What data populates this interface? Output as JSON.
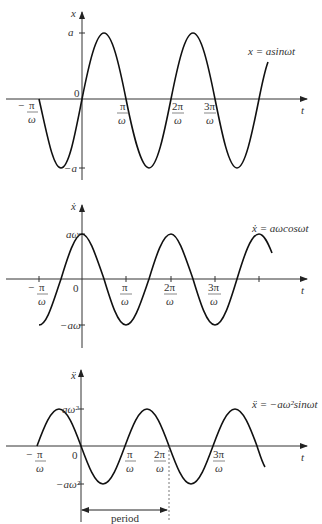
{
  "figure": {
    "cropped_header": "",
    "panels": [
      {
        "id": "displacement",
        "y_axis_label": "x",
        "x_axis_label": "t",
        "equation": "x = asinωt",
        "y_ticks": [
          "a",
          "−a"
        ],
        "origin_label": "0",
        "x_ticks": [
          "−π/ω",
          "π/ω",
          "2π/ω",
          "3π/ω"
        ]
      },
      {
        "id": "velocity",
        "y_axis_label": "ẋ",
        "x_axis_label": "t",
        "equation": "ẋ = aωcosωt",
        "y_ticks": [
          "aω",
          "−aω"
        ],
        "origin_label": "0",
        "x_ticks": [
          "−π/ω",
          "π/ω",
          "2π/ω",
          "3π/ω"
        ]
      },
      {
        "id": "acceleration",
        "y_axis_label": "ẍ",
        "x_axis_label": "t",
        "equation": "ẍ = −aω²sinωt",
        "y_ticks": [
          "aω²",
          "−aω²"
        ],
        "origin_label": "0",
        "x_ticks": [
          "−π/ω",
          "π/ω",
          "2π/ω",
          "3π/ω"
        ],
        "annotation": "period"
      }
    ]
  },
  "labels": {
    "p1": {
      "y": "x",
      "t": "t",
      "a": "a",
      "neg_a": "−a",
      "zero": "0",
      "eq": "x = asinωt"
    },
    "p2": {
      "y": "ẋ",
      "t": "t",
      "a": "aω",
      "neg_a": "−aω",
      "zero": "0",
      "eq": "ẋ = aωcosωt"
    },
    "p3": {
      "y": "ẍ",
      "t": "t",
      "a": "aω²",
      "neg_a": "−aω²",
      "zero": "0",
      "eq": "ẍ = −aω²sinωt",
      "period": "period"
    },
    "ticks": {
      "pi": "π",
      "two_pi": "2π",
      "three_pi": "3π",
      "omega": "ω",
      "minus": "−"
    }
  }
}
